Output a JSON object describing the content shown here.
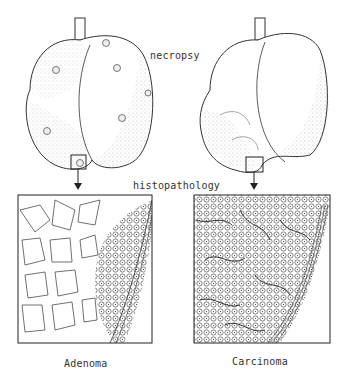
{
  "labels": {
    "necropsy": "necropsy",
    "histopathology": "histopathology",
    "adenoma": "Adenoma",
    "carcinoma": "Carcinoma"
  },
  "panels": [
    {
      "name": "Adenoma",
      "stage": "necropsy + histopathology"
    },
    {
      "name": "Carcinoma",
      "stage": "necropsy + histopathology"
    }
  ]
}
